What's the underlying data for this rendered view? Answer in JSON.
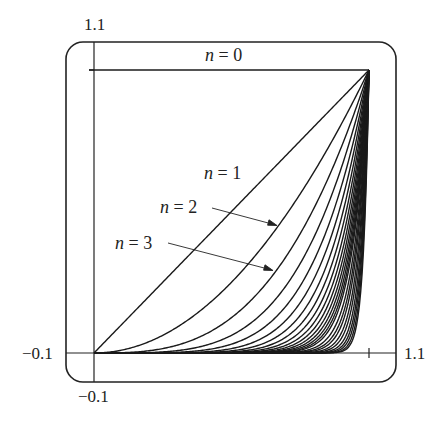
{
  "chart_data": {
    "type": "line",
    "title": "",
    "xlabel": "",
    "ylabel": "",
    "xlim": [
      -0.1,
      1.1
    ],
    "ylim": [
      -0.1,
      1.1
    ],
    "grid": false,
    "legend": "inline labels with arrows",
    "tick_labels": {
      "x_min": "-0.1",
      "x_max": "1.1",
      "y_min": "-0.1",
      "y_max": "1.1"
    },
    "function": "y = x^n on [0,1]",
    "series": [
      {
        "name": "n = 0",
        "n": 0,
        "x": [
          0,
          1
        ],
        "y": [
          1,
          1
        ]
      },
      {
        "name": "n = 1",
        "n": 1,
        "x": [
          0,
          0.5,
          1
        ],
        "y": [
          0,
          0.5,
          1
        ]
      },
      {
        "name": "n = 2",
        "n": 2,
        "x": [
          0,
          0.5,
          1
        ],
        "y": [
          0,
          0.25,
          1
        ]
      },
      {
        "name": "n = 3",
        "n": 3,
        "x": [
          0,
          0.5,
          1
        ],
        "y": [
          0,
          0.125,
          1
        ]
      }
    ],
    "additional_curves_n": [
      4,
      5,
      6,
      7,
      8,
      9,
      10,
      11,
      12,
      13,
      14,
      15,
      16,
      18,
      20,
      22,
      25,
      28,
      32,
      36,
      40,
      45,
      50
    ],
    "annotations": [
      {
        "text": "n = 0",
        "position": "above y=1 line"
      },
      {
        "text": "n = 1",
        "position": "near diagonal"
      },
      {
        "text": "n = 2",
        "arrow_to": [
          0.66,
          0.44
        ]
      },
      {
        "text": "n = 3",
        "arrow_to": [
          0.655,
          0.28
        ]
      }
    ]
  },
  "labels": {
    "y_top": "1.1",
    "y_bottom": "−0.1",
    "x_left": "−0.1",
    "x_right": "1.1",
    "n0_var": "n",
    "n0_rest": " = 0",
    "n1_var": "n",
    "n1_rest": " = 1",
    "n2_var": "n",
    "n2_rest": " = 2",
    "n3_var": "n",
    "n3_rest": " = 3"
  },
  "colors": {
    "line": "#1a1a1a",
    "frame": "#222222",
    "background": "#ffffff"
  }
}
